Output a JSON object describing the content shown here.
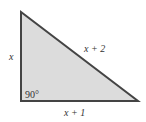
{
  "diagram": {
    "shape": "right-triangle",
    "fill_color": "#dcdcdc",
    "stroke_color": "#444444",
    "vertices": {
      "top": [
        21,
        12
      ],
      "bottom_left": [
        21,
        101
      ],
      "bottom_right": [
        138,
        101
      ]
    },
    "labels": {
      "left_side": "x",
      "hypotenuse": "x + 2",
      "bottom_side": "x + 1",
      "right_angle": "90°"
    }
  }
}
